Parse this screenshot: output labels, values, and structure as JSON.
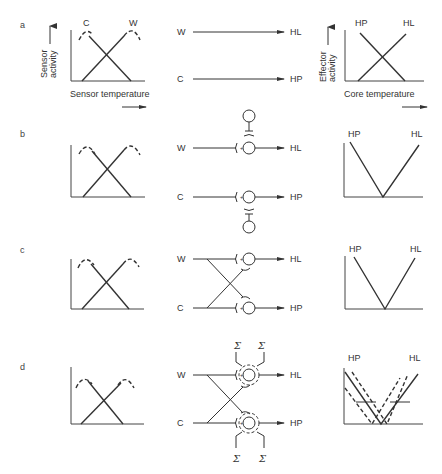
{
  "figure": {
    "panels": [
      {
        "id": "a",
        "label": "a"
      },
      {
        "id": "b",
        "label": "b"
      },
      {
        "id": "c",
        "label": "c"
      },
      {
        "id": "d",
        "label": "d"
      }
    ],
    "sensor_plot": {
      "y_axis_label_line1": "Sensor",
      "y_axis_label_line2": "activity",
      "x_axis_label": "Sensor temperature",
      "curve_cold": "C",
      "curve_warm": "W"
    },
    "effector_plot": {
      "y_axis_label_line1": "Effector",
      "y_axis_label_line2": "activity",
      "x_axis_label": "Core temperature",
      "curve_heat_production": "HP",
      "curve_heat_loss": "HL"
    },
    "circuit": {
      "input_warm": "W",
      "input_cold": "C",
      "output_heat_loss": "HL",
      "output_heat_production": "HP",
      "summation_symbol": "Σ",
      "excitatory_sign": "+",
      "inhibitory_sign": "−"
    }
  }
}
